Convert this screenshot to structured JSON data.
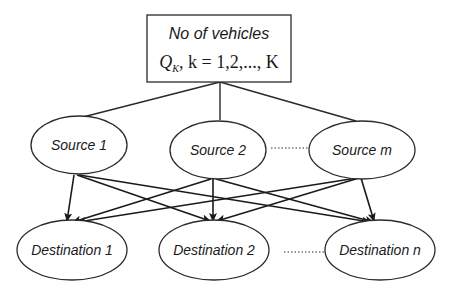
{
  "diagram": {
    "top_box": {
      "title": "No of vehicles",
      "formula_symbol": "Q",
      "formula_subscript": "K",
      "formula_rest": ", k = 1,2,..., K"
    },
    "sources": [
      {
        "label": "Source 1"
      },
      {
        "label": "Source 2"
      },
      {
        "label": "Source m"
      }
    ],
    "destinations": [
      {
        "label": "Destination 1"
      },
      {
        "label": "Destination 2"
      },
      {
        "label": "Destination n"
      }
    ],
    "source_ellipsis": "........",
    "destination_ellipsis": ".........",
    "edges": {
      "box_to_sources": [
        "Source 1",
        "Source 2",
        "Source m"
      ],
      "source_to_destination": [
        [
          "Source 1",
          "Destination 1"
        ],
        [
          "Source 1",
          "Destination 2"
        ],
        [
          "Source 1",
          "Destination n"
        ],
        [
          "Source 2",
          "Destination 1"
        ],
        [
          "Source 2",
          "Destination 2"
        ],
        [
          "Source 2",
          "Destination n"
        ],
        [
          "Source m",
          "Destination 1"
        ],
        [
          "Source m",
          "Destination 2"
        ],
        [
          "Source m",
          "Destination n"
        ]
      ]
    },
    "colors": {
      "stroke": "#2a2a2a",
      "background": "#ffffff",
      "text": "#1a1a1a"
    }
  }
}
